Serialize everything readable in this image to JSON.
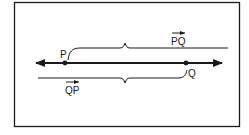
{
  "diagram": {
    "type": "ray-direction-diagram",
    "points": [
      {
        "id": "P",
        "label": "P"
      },
      {
        "id": "Q",
        "label": "Q"
      }
    ],
    "rays": [
      {
        "id": "PQ",
        "label": "PQ",
        "has_vector_arrow": true,
        "position": "above-line"
      },
      {
        "id": "QP",
        "label": "QP",
        "has_vector_arrow": true,
        "position": "below-line"
      }
    ],
    "colors": {
      "stroke": "#1a1a1a",
      "background": "#ffffff"
    }
  }
}
